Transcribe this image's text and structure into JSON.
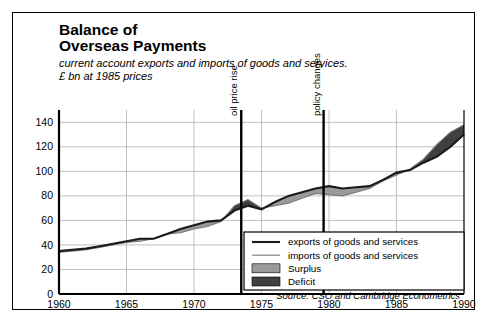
{
  "title_line1": "Balance of",
  "title_line2": "Overseas Payments",
  "subtitle_line1": "current account exports and imports of goods and services.",
  "subtitle_line2": "£ bn at 1985 prices",
  "source": "Source: CSO and Cambridge Econometrics",
  "colors": {
    "exports_line": "#1a1a1a",
    "imports_line": "#7a7a7a",
    "surplus": "#9a9a9a",
    "deficit": "#3f3f3f",
    "grid": "#b9b9b9",
    "axis": "#000000",
    "marker": "#000000"
  },
  "legend": {
    "items": [
      {
        "label": "exports of goods and services",
        "kind": "line-thick"
      },
      {
        "label": "imports of goods and services",
        "kind": "line-thin"
      },
      {
        "label": "Surplus",
        "kind": "swatch-surplus"
      },
      {
        "label": "Deficit",
        "kind": "swatch-deficit"
      }
    ]
  },
  "annotations": [
    {
      "label": "oil price rise",
      "x": 1973.5
    },
    {
      "label": "policy changes",
      "x": 1979.6
    }
  ],
  "chart_data": {
    "type": "area",
    "title": "Balance of Overseas Payments",
    "subtitle": "current account exports and imports of goods and services. £ bn at 1985 prices",
    "xlabel": "",
    "ylabel": "£ bn at 1985 prices",
    "xlim": [
      1960,
      1990
    ],
    "ylim": [
      0,
      150
    ],
    "yticks": [
      0,
      20,
      40,
      60,
      80,
      100,
      120,
      140
    ],
    "xticks": [
      1960,
      1965,
      1970,
      1975,
      1980,
      1985,
      1990
    ],
    "grid": true,
    "legend_position": "inside-bottom-right",
    "x": [
      1960,
      1961,
      1962,
      1963,
      1964,
      1965,
      1966,
      1967,
      1968,
      1969,
      1970,
      1971,
      1972,
      1973,
      1974,
      1975,
      1976,
      1977,
      1978,
      1979,
      1980,
      1981,
      1982,
      1983,
      1984,
      1985,
      1986,
      1987,
      1988,
      1989,
      1990
    ],
    "series": [
      {
        "name": "exports of goods and services",
        "values": [
          35,
          36,
          37,
          39,
          41,
          43,
          45,
          45,
          49,
          53,
          56,
          59,
          60,
          68,
          72,
          69,
          75,
          80,
          83,
          86,
          88,
          86,
          87,
          88,
          93,
          99,
          101,
          107,
          112,
          120,
          130
        ]
      },
      {
        "name": "imports of goods and services",
        "values": [
          34,
          35,
          36,
          38,
          40,
          42,
          43,
          45,
          49,
          50,
          53,
          55,
          59,
          72,
          77,
          70,
          72,
          74,
          78,
          82,
          81,
          80,
          83,
          86,
          92,
          97,
          102,
          110,
          122,
          132,
          138
        ]
      }
    ],
    "bands": [
      {
        "name": "Surplus",
        "meaning": "exports above imports",
        "color": "#9a9a9a"
      },
      {
        "name": "Deficit",
        "meaning": "imports above exports",
        "color": "#3f3f3f"
      }
    ],
    "annotations": [
      {
        "label": "oil price rise",
        "x": 1973.5,
        "type": "vertical-line"
      },
      {
        "label": "policy changes",
        "x": 1979.6,
        "type": "vertical-line"
      }
    ]
  }
}
